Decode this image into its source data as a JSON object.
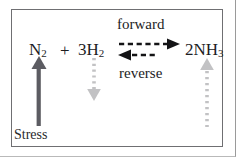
{
  "diagram": {
    "title_text": "",
    "box": {
      "border_color": "#6f6f72"
    },
    "equation": {
      "reactant1": "N",
      "reactant1_sub": "2",
      "plus": "+",
      "reactant2": "3H",
      "reactant2_sub": "2",
      "product": "2NH",
      "product_sub": "3"
    },
    "rates": {
      "forward_label": "forward",
      "reverse_label": "reverse"
    },
    "stress": {
      "label": "Stress"
    },
    "arrows": [
      {
        "name": "n2-stress-arrow",
        "style": "solid",
        "direction": "up",
        "color": "#5c5c62",
        "meaning": "N2 added / increased"
      },
      {
        "name": "h2-shift-arrow",
        "style": "dotted",
        "direction": "down",
        "color": "#c2c2c4",
        "meaning": "H2 decreases"
      },
      {
        "name": "nh3-shift-arrow",
        "style": "dotted",
        "direction": "up",
        "color": "#c2c2c4",
        "meaning": "NH3 increases"
      },
      {
        "name": "forward-rate-arrow",
        "style": "dashed",
        "direction": "right",
        "color": "#141416",
        "meaning": "forward reaction"
      },
      {
        "name": "reverse-rate-arrow",
        "style": "dashed",
        "direction": "left",
        "color": "#141416",
        "meaning": "reverse reaction"
      }
    ],
    "colors": {
      "text": "#1d1d1f",
      "solid_arrow": "#5c5c62",
      "dotted_arrow": "#c2c2c4",
      "dashed_arrow": "#141416",
      "box_border": "#6f6f72",
      "background": "#ffffff"
    }
  }
}
